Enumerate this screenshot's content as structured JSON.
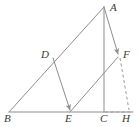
{
  "figure": {
    "kind": "geometry-diagram",
    "width": 139,
    "height": 127,
    "background_color": "#ffffff",
    "stroke_color": "#8d8d8d",
    "dashed_stroke_color": "#9a9a9a",
    "label_color": "#3a3a3a",
    "stroke_width": 1
  },
  "points": {
    "A": {
      "label": "A",
      "x": 104,
      "y": 7,
      "label_x": 110,
      "label_y": 2
    },
    "B": {
      "label": "B",
      "x": 9,
      "y": 112,
      "label_x": 4,
      "label_y": 113
    },
    "C": {
      "label": "C",
      "x": 104,
      "y": 112,
      "label_x": 100,
      "label_y": 113
    },
    "D": {
      "label": "D",
      "x": 53,
      "y": 58,
      "label_x": 41,
      "label_y": 49
    },
    "E": {
      "label": "E",
      "x": 70,
      "y": 112,
      "label_x": 65,
      "label_y": 113
    },
    "F": {
      "label": "F",
      "x": 119,
      "y": 56,
      "label_x": 123,
      "label_y": 49
    },
    "H": {
      "label": "H",
      "x": 128,
      "y": 112,
      "label_x": 123,
      "label_y": 113
    }
  },
  "segments": [
    {
      "name": "base-BH",
      "from": "B",
      "to": "H",
      "style": "solid",
      "arrow": "none"
    },
    {
      "name": "hypotenuse-BA",
      "from": "B",
      "to": "A",
      "style": "solid",
      "arrow": "none"
    },
    {
      "name": "altitude-AC",
      "from": "A",
      "to": "C",
      "style": "solid",
      "arrow": "none"
    },
    {
      "name": "vector-DE",
      "from": "D",
      "to": "E",
      "style": "solid",
      "arrow": "end"
    },
    {
      "name": "vector-AF",
      "from": "A",
      "to": "F",
      "style": "solid",
      "arrow": "end"
    },
    {
      "name": "segment-EF",
      "from": "E",
      "to": "F",
      "style": "solid",
      "arrow": "none"
    },
    {
      "name": "dashed-CH",
      "from": "C",
      "to": "H",
      "style": "dashed",
      "arrow": "none"
    },
    {
      "name": "dashed-FH",
      "from": "F",
      "to": "H",
      "style": "dashed",
      "arrow": "none"
    }
  ],
  "labels": [
    "A",
    "B",
    "C",
    "D",
    "E",
    "F",
    "H"
  ]
}
